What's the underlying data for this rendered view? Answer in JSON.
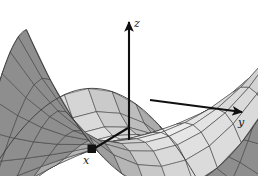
{
  "figure": {
    "title": "",
    "width": 258,
    "height": 176,
    "background_color": "#ffffff"
  },
  "axes": {
    "x": {
      "label": "x",
      "label_style": "italic",
      "arrow_color": "#101010",
      "arrow_head": "square"
    },
    "y": {
      "label": "y",
      "label_style": "italic",
      "arrow_color": "#101010",
      "arrow_head": "triangle"
    },
    "z": {
      "label": "z",
      "label_style": "italic",
      "arrow_color": "#101010",
      "arrow_head": "triangle"
    }
  },
  "chart_data": {
    "type": "surface",
    "title": "",
    "xlabel": "x",
    "ylabel": "y",
    "zlabel": "z",
    "surface_description": "monkey-saddle style 3D surface mesh rendered in grayscale with wireframe grid lines",
    "function": "z = x^3 - 3xy^2",
    "domain": {
      "u_range": [
        -1.35,
        1.35
      ],
      "v_range": [
        -1.35,
        1.35
      ]
    },
    "mesh": {
      "u_divisions": 13,
      "v_divisions": 13,
      "grid": true
    },
    "shading": {
      "colormap": "grayscale",
      "light_color": "#f2f2f2",
      "mid_color": "#c0c0c0",
      "dark_color": "#8e8e8e",
      "line_color": "#3a3a3a"
    },
    "projection": {
      "origin_px": [
        129,
        139
      ],
      "x_axis_vector_px": [
        -39,
        13
      ],
      "y_axis_vector_px": [
        115,
        -30
      ],
      "z_axis_vector_px": [
        0,
        -121
      ]
    },
    "legend": {
      "visible": false,
      "position": "none"
    },
    "axis_ranges": {
      "x": [
        -1.35,
        1.35
      ],
      "y": [
        -1.35,
        1.35
      ],
      "z": [
        -4.5,
        4.5
      ]
    }
  }
}
